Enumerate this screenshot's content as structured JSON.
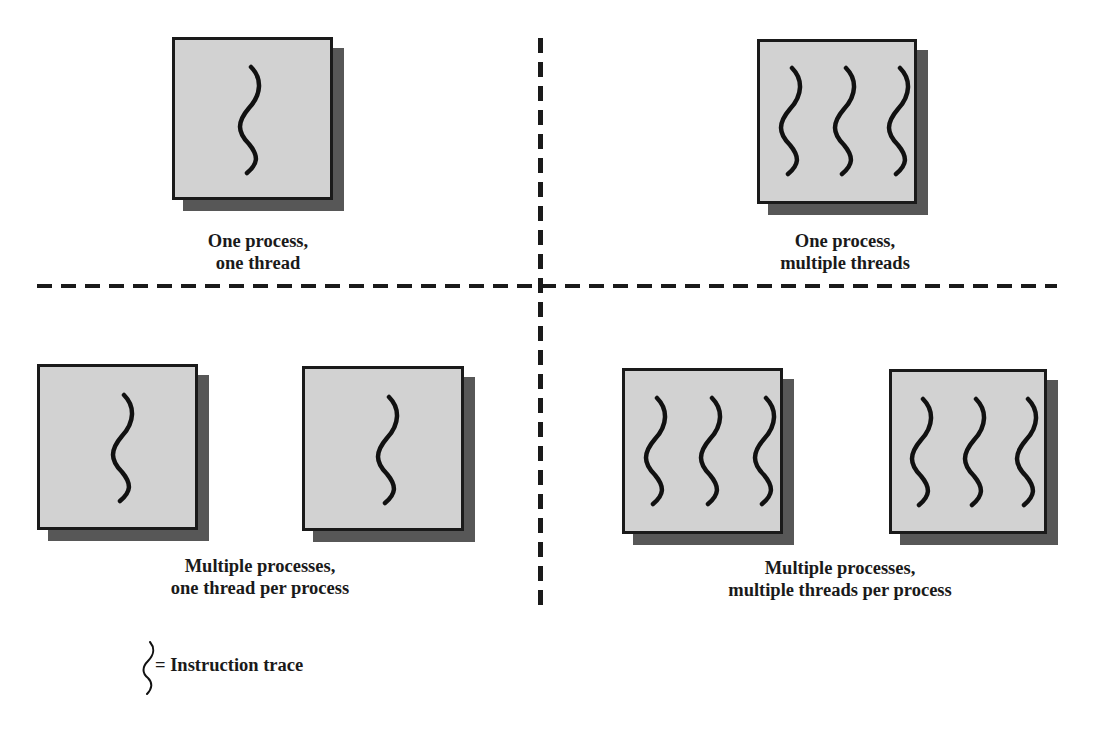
{
  "diagram": {
    "type": "threads-and-processes",
    "quadrants": [
      {
        "id": "one-process-one-thread",
        "caption_line1": "One process,",
        "caption_line2": "one thread",
        "processes": [
          {
            "threads": 1
          }
        ]
      },
      {
        "id": "one-process-multiple-threads",
        "caption_line1": "One process,",
        "caption_line2": "multiple threads",
        "processes": [
          {
            "threads": 3
          }
        ]
      },
      {
        "id": "multiple-processes-one-thread",
        "caption_line1": "Multiple processes,",
        "caption_line2": "one thread per process",
        "processes": [
          {
            "threads": 1
          },
          {
            "threads": 1
          }
        ]
      },
      {
        "id": "multiple-processes-multiple-threads",
        "caption_line1": "Multiple processes,",
        "caption_line2": "multiple threads per process",
        "processes": [
          {
            "threads": 3
          },
          {
            "threads": 3
          }
        ]
      }
    ],
    "legend": {
      "symbol": "wavy-line",
      "label": "= Instruction trace"
    },
    "colors": {
      "process_fill": "#d2d2d2",
      "process_border": "#1a1a1a",
      "shadow": "#575757",
      "thread_stroke": "#111111",
      "divider": "#1a1a1a"
    }
  }
}
